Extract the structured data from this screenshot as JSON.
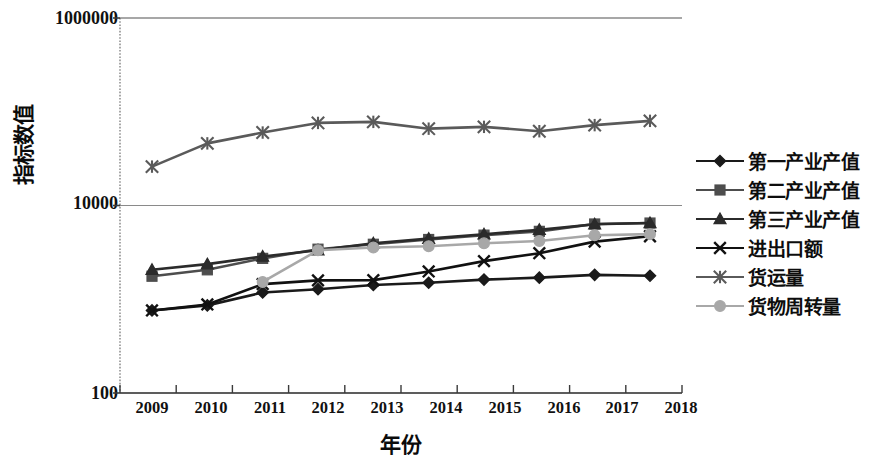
{
  "chart_data": {
    "type": "line",
    "title": "",
    "xlabel": "年份",
    "ylabel": "指标数值",
    "yscale": "log",
    "ylim": [
      100,
      1000000
    ],
    "grid": true,
    "legend_position": "right",
    "categories": [
      "2009",
      "2010",
      "2011",
      "2012",
      "2013",
      "2014",
      "2015",
      "2016",
      "2017",
      "2018"
    ],
    "ytick_labels": [
      "1000000",
      "10000",
      "100"
    ],
    "ytick_values": [
      1000000,
      10000,
      100
    ],
    "series": [
      {
        "name": "第一产业产值",
        "marker": "diamond",
        "color": "#1a1a1a",
        "values": [
          760,
          860,
          1180,
          1280,
          1420,
          1500,
          1620,
          1700,
          1820,
          1780
        ]
      },
      {
        "name": "第二产业产值",
        "marker": "square",
        "color": "#4d4d4d",
        "values": [
          1760,
          2060,
          2730,
          3420,
          3860,
          4340,
          4830,
          5300,
          6350,
          6500
        ]
      },
      {
        "name": "第三产业产值",
        "marker": "triangle",
        "color": "#2b2b2b",
        "values": [
          2060,
          2370,
          2860,
          3330,
          3950,
          4430,
          4940,
          5500,
          6300,
          6500
        ]
      },
      {
        "name": "进出口额",
        "marker": "cross",
        "color": "#111111",
        "values": [
          760,
          880,
          1450,
          1590,
          1600,
          1980,
          2550,
          3100,
          4120,
          4700
        ]
      },
      {
        "name": "货运量",
        "marker": "asterisk",
        "color": "#5a5a5a",
        "values": [
          26000,
          46000,
          60000,
          76000,
          78000,
          66000,
          69000,
          62000,
          72000,
          80000
        ]
      },
      {
        "name": "货物周转量",
        "marker": "circle",
        "color": "#a8a8a8",
        "values": [
          null,
          null,
          1530,
          3330,
          3560,
          3680,
          3950,
          4180,
          4820,
          4950
        ]
      }
    ]
  }
}
